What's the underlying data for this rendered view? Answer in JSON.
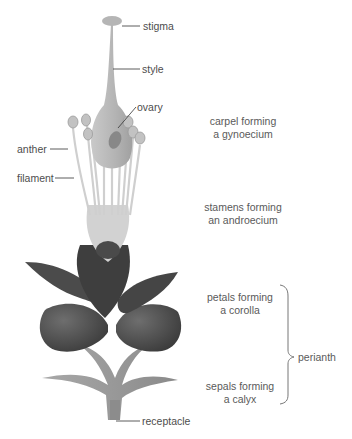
{
  "labels": {
    "stigma": "stigma",
    "style": "style",
    "ovary": "ovary",
    "anther": "anther",
    "filament": "filament",
    "receptacle": "receptacle"
  },
  "groups": {
    "carpel_line1": "carpel forming",
    "carpel_line2": "a gynoecium",
    "stamens_line1": "stamens forming",
    "stamens_line2": "an androecium",
    "petals_line1": "petals forming",
    "petals_line2": "a corolla",
    "sepals_line1": "sepals forming",
    "sepals_line2": "a calyx",
    "perianth": "perianth"
  },
  "colors": {
    "carpel": "#bdbdbd",
    "stamen": "#c8c8c8",
    "petal_dark": "#4a4a4a",
    "sepal": "#9a9a9a",
    "leader_line": "#333333"
  }
}
